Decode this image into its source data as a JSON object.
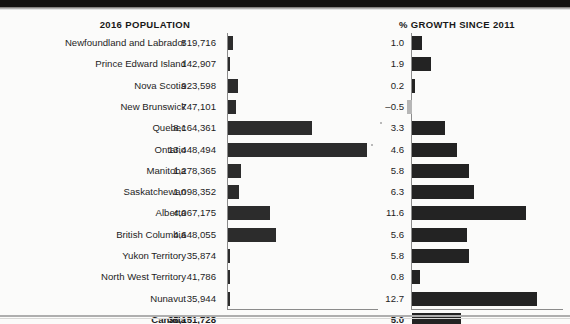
{
  "panels": {
    "population_title": "2016 POPULATION",
    "growth_title": "% GROWTH SINCE 2011"
  },
  "colors": {
    "bar_positive": "#232323",
    "bar_negative": "#b6b6b6",
    "axis": "#8b8b8b",
    "text": "#1d1d1d"
  },
  "chart_data": {
    "type": "bar",
    "orientation": "horizontal",
    "grid": false,
    "legend": "none",
    "categories": [
      "Newfoundland and Labrador",
      "Prince Edward Island",
      "Nova Scotia",
      "New Brunswick",
      "Quebec",
      "Ontario",
      "Manitoba",
      "Saskatchewan",
      "Alberta",
      "British Columbia",
      "Yukon Territory",
      "North West Territory",
      "Nunavut",
      "Canada"
    ],
    "series": [
      {
        "name": "2016 POPULATION",
        "xlabel": "",
        "ylabel": "",
        "xlim": [
          0,
          14000000
        ],
        "values": [
          519716,
          142907,
          923598,
          747101,
          8164361,
          13448494,
          1278365,
          1098352,
          4067175,
          4648055,
          35874,
          41786,
          35944,
          35151728
        ],
        "value_labels": [
          "519,716",
          "142,907",
          "923,598",
          "747,101",
          "8,164,361",
          "13,448,494",
          "1,278,365",
          "1,098,352",
          "4,067,175",
          "4,648,055",
          "35,874",
          "41,786",
          "35,944",
          "35,151,728"
        ],
        "bars_drawn": [
          true,
          true,
          true,
          true,
          true,
          true,
          true,
          true,
          true,
          true,
          true,
          true,
          true,
          false
        ]
      },
      {
        "name": "% GROWTH SINCE 2011",
        "xlabel": "",
        "ylabel": "",
        "xlim": [
          -1,
          13
        ],
        "values": [
          1.0,
          1.9,
          0.2,
          -0.5,
          3.3,
          4.6,
          5.8,
          6.3,
          11.6,
          5.6,
          5.8,
          0.8,
          12.7,
          5.0
        ],
        "value_labels": [
          "1.0",
          "1.9",
          "0.2",
          "-0.5",
          "3.3",
          "4.6",
          "5.8",
          "6.3",
          "11.6",
          "5.6",
          "5.8",
          "0.8",
          "12.7",
          "5.0"
        ],
        "bars_drawn": [
          true,
          true,
          true,
          true,
          true,
          true,
          true,
          true,
          true,
          true,
          true,
          true,
          true,
          true
        ]
      }
    ]
  }
}
